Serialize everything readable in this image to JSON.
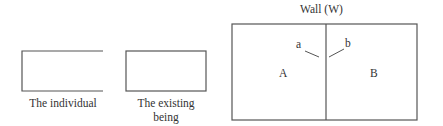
{
  "diagram": {
    "figures": [
      {
        "id": "individual",
        "caption": "The individual",
        "right_side_open": true
      },
      {
        "id": "existing-being",
        "caption_line1": "The existing",
        "caption_line2": "being",
        "right_side_open": false
      },
      {
        "id": "wall",
        "title": "Wall (W)",
        "regions": [
          {
            "label": "A"
          },
          {
            "label": "B"
          }
        ],
        "points": [
          {
            "label": "a"
          },
          {
            "label": "b"
          }
        ]
      }
    ],
    "colors": {
      "line": "#555555",
      "text": "#333333",
      "background": "#ffffff"
    }
  }
}
